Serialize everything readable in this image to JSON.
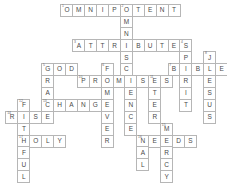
{
  "puzzle": {
    "title": "Crossword Puzzle Grid",
    "cell_size": 13,
    "origin_x": 14,
    "origin_y": 4,
    "colors": {
      "cell_background": "#ffffff",
      "cell_border": "#b6b6b6",
      "letter": "#4a4a4a",
      "number": "#6b6b6b",
      "page_background": "#ffffff"
    },
    "entries": [
      {
        "number": "1",
        "answer": "OMNIPOTENT",
        "direction": "across",
        "row": 0,
        "col": 4
      },
      {
        "number": "2",
        "answer": "OMNISCIENCE",
        "direction": "down",
        "row": 0,
        "col": 8
      },
      {
        "number": "3",
        "answer": "ATTRIBUTES",
        "direction": "across",
        "row": 3,
        "col": 5
      },
      {
        "number": "4",
        "answer": "SPIRIT",
        "direction": "down",
        "row": 3,
        "col": 12
      },
      {
        "number": "5",
        "answer": "GOD",
        "direction": "across",
        "row": 6,
        "col": 2
      },
      {
        "number": "6",
        "answer": "FORGIVER",
        "direction": "down",
        "row": 6,
        "col": 7
      },
      {
        "number": "7",
        "answer": "BIBLE",
        "direction": "across",
        "row": 6,
        "col": 11
      },
      {
        "number": "8",
        "answer": "JESUS",
        "direction": "down",
        "row": 6,
        "col": 15
      },
      {
        "number": "9",
        "answer": "GRACE",
        "direction": "down",
        "row": 6,
        "col": 2
      },
      {
        "number": "10",
        "answer": "PROMISES",
        "direction": "across",
        "row": 7,
        "col": 4
      },
      {
        "number": "11",
        "answer": "ETERNAL",
        "direction": "down",
        "row": 7,
        "col": 10
      },
      {
        "number": "12",
        "answer": "FAITHFUL",
        "direction": "down",
        "row": 8,
        "col": 0
      },
      {
        "number": "13",
        "answer": "CHANGE",
        "direction": "across",
        "row": 9,
        "col": 2
      },
      {
        "number": "14",
        "answer": "RISE",
        "direction": "across",
        "row": 10,
        "col": -1
      },
      {
        "number": "15",
        "answer": "MERCY",
        "direction": "down",
        "row": 10,
        "col": 12
      },
      {
        "number": "16",
        "answer": "NEEDS",
        "direction": "across",
        "row": 11,
        "col": 10
      },
      {
        "number": "17",
        "answer": "HOLY",
        "direction": "across",
        "row": 12,
        "col": 0
      }
    ],
    "cells": [
      {
        "x": 66,
        "y": 4,
        "letter": "O",
        "num": "1"
      },
      {
        "x": 79,
        "y": 4,
        "letter": "M",
        "num": ""
      },
      {
        "x": 92,
        "y": 4,
        "letter": "N",
        "num": ""
      },
      {
        "x": 105,
        "y": 4,
        "letter": "I",
        "num": ""
      },
      {
        "x": 118,
        "y": 4,
        "letter": "P",
        "num": ""
      },
      {
        "x": 131,
        "y": 4,
        "letter": "O",
        "num": "2"
      },
      {
        "x": 144,
        "y": 4,
        "letter": "T",
        "num": ""
      },
      {
        "x": 157,
        "y": 4,
        "letter": "E",
        "num": ""
      },
      {
        "x": 170,
        "y": 4,
        "letter": "N",
        "num": ""
      },
      {
        "x": 183,
        "y": 4,
        "letter": "T",
        "num": ""
      },
      {
        "x": 131,
        "y": 17,
        "letter": "M",
        "num": ""
      },
      {
        "x": 131,
        "y": 30,
        "letter": "N",
        "num": ""
      },
      {
        "x": 79,
        "y": 43,
        "letter": "A",
        "num": "3"
      },
      {
        "x": 92,
        "y": 43,
        "letter": "T",
        "num": ""
      },
      {
        "x": 105,
        "y": 43,
        "letter": "T",
        "num": ""
      },
      {
        "x": 118,
        "y": 43,
        "letter": "R",
        "num": ""
      },
      {
        "x": 131,
        "y": 43,
        "letter": "I",
        "num": ""
      },
      {
        "x": 144,
        "y": 43,
        "letter": "B",
        "num": ""
      },
      {
        "x": 157,
        "y": 43,
        "letter": "U",
        "num": ""
      },
      {
        "x": 170,
        "y": 43,
        "letter": "T",
        "num": ""
      },
      {
        "x": 183,
        "y": 43,
        "letter": "E",
        "num": ""
      },
      {
        "x": 196,
        "y": 43,
        "letter": "S",
        "num": "4"
      },
      {
        "x": 131,
        "y": 56,
        "letter": "S",
        "num": ""
      },
      {
        "x": 196,
        "y": 56,
        "letter": "P",
        "num": ""
      },
      {
        "x": 222,
        "y": 56,
        "letter": "J",
        "num": "8"
      },
      {
        "x": 45,
        "y": 69,
        "letter": "G",
        "num": "5"
      },
      {
        "x": 58,
        "y": 69,
        "letter": "O",
        "num": ""
      },
      {
        "x": 71,
        "y": 69,
        "letter": "D",
        "num": ""
      },
      {
        "x": 110,
        "y": 69,
        "letter": "F",
        "num": "6"
      },
      {
        "x": 131,
        "y": 69,
        "letter": "C",
        "num": ""
      },
      {
        "x": 183,
        "y": 69,
        "letter": "B",
        "num": "7"
      },
      {
        "x": 196,
        "y": 69,
        "letter": "I",
        "num": ""
      },
      {
        "x": 209,
        "y": 69,
        "letter": "B",
        "num": ""
      },
      {
        "x": 222,
        "y": 69,
        "letter": "L",
        "num": ""
      },
      {
        "x": 235,
        "y": 69,
        "letter": "E",
        "num": ""
      },
      {
        "x": 45,
        "y": 82,
        "letter": "R",
        "num": ""
      },
      {
        "x": 84,
        "y": 82,
        "letter": "P",
        "num": "10"
      },
      {
        "x": 97,
        "y": 82,
        "letter": "R",
        "num": ""
      },
      {
        "x": 110,
        "y": 82,
        "letter": "O",
        "num": ""
      },
      {
        "x": 123,
        "y": 82,
        "letter": "M",
        "num": ""
      },
      {
        "x": 136,
        "y": 82,
        "letter": "I",
        "num": ""
      },
      {
        "x": 149,
        "y": 82,
        "letter": "S",
        "num": ""
      },
      {
        "x": 162,
        "y": 82,
        "letter": "E",
        "num": "11"
      },
      {
        "x": 175,
        "y": 82,
        "letter": "S",
        "num": ""
      },
      {
        "x": 196,
        "y": 82,
        "letter": "R",
        "num": ""
      },
      {
        "x": 222,
        "y": 82,
        "letter": "E",
        "num": ""
      },
      {
        "x": 45,
        "y": 95,
        "letter": "A",
        "num": ""
      },
      {
        "x": 110,
        "y": 95,
        "letter": "M",
        "num": ""
      },
      {
        "x": 136,
        "y": 95,
        "letter": "E",
        "num": ""
      },
      {
        "x": 162,
        "y": 95,
        "letter": "T",
        "num": ""
      },
      {
        "x": 196,
        "y": 95,
        "letter": "I",
        "num": ""
      },
      {
        "x": 222,
        "y": 95,
        "letter": "S",
        "num": ""
      },
      {
        "x": 19,
        "y": 108,
        "letter": "F",
        "num": "12"
      },
      {
        "x": 45,
        "y": 108,
        "letter": "C",
        "num": "13"
      },
      {
        "x": 58,
        "y": 108,
        "letter": "H",
        "num": ""
      },
      {
        "x": 71,
        "y": 108,
        "letter": "A",
        "num": ""
      },
      {
        "x": 84,
        "y": 108,
        "letter": "N",
        "num": ""
      },
      {
        "x": 97,
        "y": 108,
        "letter": "G",
        "num": ""
      },
      {
        "x": 110,
        "y": 108,
        "letter": "E",
        "num": ""
      },
      {
        "x": 136,
        "y": 108,
        "letter": "N",
        "num": ""
      },
      {
        "x": 162,
        "y": 108,
        "letter": "E",
        "num": ""
      },
      {
        "x": 196,
        "y": 108,
        "letter": "T",
        "num": ""
      },
      {
        "x": 222,
        "y": 108,
        "letter": "U",
        "num": ""
      },
      {
        "x": 6,
        "y": 121,
        "letter": "R",
        "num": "14"
      },
      {
        "x": 19,
        "y": 121,
        "letter": "I",
        "num": ""
      },
      {
        "x": 32,
        "y": 121,
        "letter": "S",
        "num": ""
      },
      {
        "x": 45,
        "y": 121,
        "letter": "E",
        "num": ""
      },
      {
        "x": 110,
        "y": 121,
        "letter": "V",
        "num": ""
      },
      {
        "x": 136,
        "y": 121,
        "letter": "C",
        "num": ""
      },
      {
        "x": 162,
        "y": 121,
        "letter": "R",
        "num": ""
      },
      {
        "x": 222,
        "y": 121,
        "letter": "S",
        "num": ""
      },
      {
        "x": 19,
        "y": 134,
        "letter": "T",
        "num": ""
      },
      {
        "x": 110,
        "y": 134,
        "letter": "E",
        "num": ""
      },
      {
        "x": 136,
        "y": 134,
        "letter": "E",
        "num": ""
      },
      {
        "x": 175,
        "y": 134,
        "letter": "M",
        "num": "15"
      },
      {
        "x": 19,
        "y": 147,
        "letter": "H",
        "num": "17"
      },
      {
        "x": 32,
        "y": 147,
        "letter": "O",
        "num": ""
      },
      {
        "x": 45,
        "y": 147,
        "letter": "L",
        "num": ""
      },
      {
        "x": 58,
        "y": 147,
        "letter": "Y",
        "num": ""
      },
      {
        "x": 110,
        "y": 147,
        "letter": "R",
        "num": ""
      },
      {
        "x": 149,
        "y": 147,
        "letter": "N",
        "num": "16"
      },
      {
        "x": 162,
        "y": 147,
        "letter": "E",
        "num": ""
      },
      {
        "x": 175,
        "y": 147,
        "letter": "E",
        "num": ""
      },
      {
        "x": 188,
        "y": 147,
        "letter": "D",
        "num": ""
      },
      {
        "x": 201,
        "y": 147,
        "letter": "S",
        "num": ""
      },
      {
        "x": 19,
        "y": 160,
        "letter": "F",
        "num": ""
      },
      {
        "x": 149,
        "y": 160,
        "letter": "A",
        "num": ""
      },
      {
        "x": 175,
        "y": 160,
        "letter": "R",
        "num": ""
      },
      {
        "x": 19,
        "y": 173,
        "letter": "U",
        "num": ""
      },
      {
        "x": 149,
        "y": 173,
        "letter": "L",
        "num": ""
      },
      {
        "x": 175,
        "y": 173,
        "letter": "C",
        "num": ""
      },
      {
        "x": 19,
        "y": 186,
        "letter": "L",
        "num": ""
      },
      {
        "x": 175,
        "y": 186,
        "letter": "Y",
        "num": ""
      }
    ]
  }
}
